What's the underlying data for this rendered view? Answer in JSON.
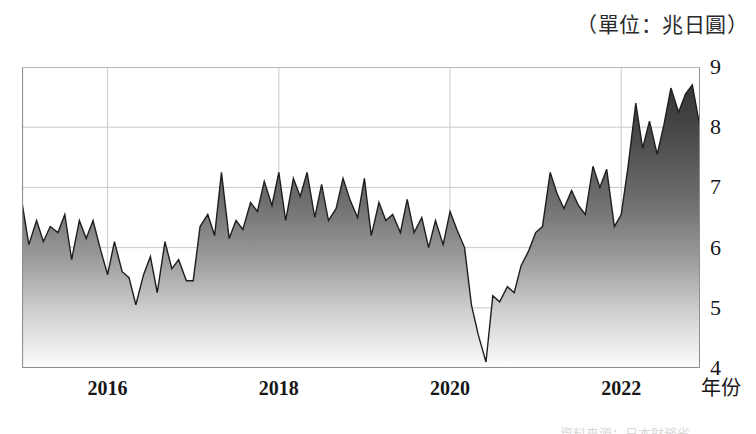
{
  "caption": {
    "unit_label": "（單位：兆日圓）",
    "source_note": "資料來源：日本財務省"
  },
  "axes": {
    "x_axis_title": "年份",
    "x_tick_labels": [
      "2016",
      "2018",
      "2020",
      "2022"
    ],
    "x_tick_values": [
      2016,
      2018,
      2020,
      2022
    ],
    "y_tick_labels": [
      "9",
      "8",
      "7",
      "6",
      "5",
      "4"
    ],
    "y_tick_values": [
      9,
      8,
      7,
      6,
      5,
      4
    ]
  },
  "style": {
    "area_top_color": "#3a3a3a",
    "area_bottom_color": "#fbfbfb",
    "line_color": "#1e1e1e",
    "grid_color": "#c9c9c9",
    "axis_color": "#8f8f8f",
    "background": "#ffffff"
  },
  "chart_data": {
    "type": "area",
    "title": "",
    "subtitle": "",
    "xlabel": "年份",
    "ylabel": "",
    "unit": "兆日圓",
    "xlim": [
      2015.0,
      2022.92
    ],
    "ylim": [
      4,
      9
    ],
    "grid": true,
    "legend": "none",
    "x_major_ticks": [
      2016,
      2018,
      2020,
      2022
    ],
    "y_major_ticks": [
      4,
      5,
      6,
      7,
      8,
      9
    ],
    "x": [
      2015.0,
      2015.08,
      2015.17,
      2015.25,
      2015.33,
      2015.42,
      2015.5,
      2015.58,
      2015.67,
      2015.75,
      2015.83,
      2015.92,
      2016.0,
      2016.08,
      2016.17,
      2016.25,
      2016.33,
      2016.42,
      2016.5,
      2016.58,
      2016.67,
      2016.75,
      2016.83,
      2016.92,
      2017.0,
      2017.08,
      2017.17,
      2017.25,
      2017.33,
      2017.42,
      2017.5,
      2017.58,
      2017.67,
      2017.75,
      2017.83,
      2017.92,
      2018.0,
      2018.08,
      2018.17,
      2018.25,
      2018.33,
      2018.42,
      2018.5,
      2018.58,
      2018.67,
      2018.75,
      2018.83,
      2018.92,
      2019.0,
      2019.08,
      2019.17,
      2019.25,
      2019.33,
      2019.42,
      2019.5,
      2019.58,
      2019.67,
      2019.75,
      2019.83,
      2019.92,
      2020.0,
      2020.08,
      2020.17,
      2020.25,
      2020.33,
      2020.42,
      2020.5,
      2020.58,
      2020.67,
      2020.75,
      2020.83,
      2020.92,
      2021.0,
      2021.08,
      2021.17,
      2021.25,
      2021.33,
      2021.42,
      2021.5,
      2021.58,
      2021.67,
      2021.75,
      2021.83,
      2021.92,
      2022.0,
      2022.08,
      2022.17,
      2022.25,
      2022.33,
      2022.42,
      2022.5,
      2022.58,
      2022.67,
      2022.75,
      2022.83,
      2022.92
    ],
    "values": [
      6.75,
      6.05,
      6.45,
      6.1,
      6.35,
      6.25,
      6.55,
      5.8,
      6.45,
      6.15,
      6.45,
      5.95,
      5.55,
      6.1,
      5.6,
      5.5,
      5.05,
      5.55,
      5.85,
      5.25,
      6.1,
      5.65,
      5.8,
      5.45,
      5.45,
      6.35,
      6.55,
      6.2,
      7.25,
      6.15,
      6.45,
      6.3,
      6.75,
      6.6,
      7.1,
      6.7,
      7.25,
      6.45,
      7.15,
      6.85,
      7.25,
      6.5,
      7.05,
      6.45,
      6.65,
      7.15,
      6.8,
      6.5,
      7.15,
      6.2,
      6.75,
      6.45,
      6.55,
      6.25,
      6.8,
      6.25,
      6.5,
      6.0,
      6.45,
      6.05,
      6.6,
      6.3,
      6.0,
      5.05,
      4.55,
      4.1,
      5.2,
      5.1,
      5.35,
      5.25,
      5.7,
      5.95,
      6.25,
      6.35,
      7.25,
      6.9,
      6.65,
      6.95,
      6.7,
      6.55,
      7.35,
      7.0,
      7.3,
      6.35,
      6.55,
      7.35,
      8.4,
      7.65,
      8.1,
      7.55,
      8.05,
      8.65,
      8.25,
      8.55,
      8.7,
      8.0
    ]
  }
}
